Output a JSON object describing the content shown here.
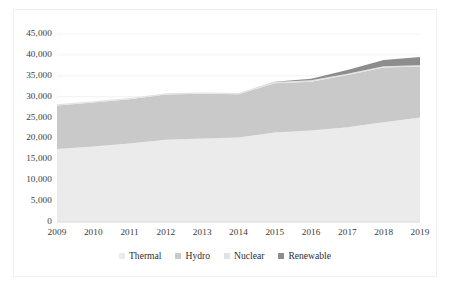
{
  "chart_data": {
    "type": "area",
    "stacked": true,
    "title": "",
    "xlabel": "",
    "ylabel": "",
    "x": [
      2009,
      2010,
      2011,
      2012,
      2013,
      2014,
      2015,
      2016,
      2017,
      2018,
      2019
    ],
    "categories": [
      "2009",
      "2010",
      "2011",
      "2012",
      "2013",
      "2014",
      "2015",
      "2016",
      "2017",
      "2018",
      "2019"
    ],
    "series": [
      {
        "name": "Thermal",
        "color": "#ebebeb",
        "values": [
          17500,
          18100,
          18800,
          19700,
          20000,
          20200,
          21400,
          21900,
          22700,
          23900,
          25000
        ]
      },
      {
        "name": "Hydro",
        "color": "#c9c9c9",
        "values": [
          10400,
          10500,
          10600,
          10800,
          10700,
          10400,
          11800,
          11700,
          12500,
          13100,
          12200
        ]
      },
      {
        "name": "Nuclear",
        "color": "#e3e3e3",
        "values": [
          300,
          300,
          300,
          300,
          300,
          300,
          300,
          300,
          300,
          300,
          300
        ]
      },
      {
        "name": "Renewable",
        "color": "#8d8d8d",
        "values": [
          0,
          0,
          0,
          0,
          0,
          0,
          100,
          400,
          900,
          1500,
          2000
        ]
      }
    ],
    "totals": [
      28200,
      28900,
      29700,
      30800,
      31000,
      30900,
      33600,
      34300,
      36400,
      38800,
      39500
    ],
    "ylim": [
      0,
      45000
    ],
    "yticks": [
      0,
      5000,
      10000,
      15000,
      20000,
      25000,
      30000,
      35000,
      40000,
      45000
    ],
    "ytick_labels": [
      "0",
      "5,000",
      "10,000",
      "15,000",
      "20,000",
      "25,000",
      "30,000",
      "35,000",
      "40,000",
      "45,000"
    ],
    "grid": true,
    "legend_position": "bottom",
    "legend": [
      "Thermal",
      "Hydro",
      "Nuclear",
      "Renewable"
    ]
  },
  "legend": {
    "items": [
      {
        "label": "Thermal",
        "color": "#ebebeb"
      },
      {
        "label": "Hydro",
        "color": "#c9c9c9"
      },
      {
        "label": "Nuclear",
        "color": "#e3e3e3"
      },
      {
        "label": "Renewable",
        "color": "#8d8d8d"
      }
    ]
  },
  "axis": {
    "y_labels": [
      "45,000",
      "40,000",
      "35,000",
      "30,000",
      "25,000",
      "20,000",
      "15,000",
      "10,000",
      "5,000",
      "0"
    ],
    "x_labels": [
      "2009",
      "2010",
      "2011",
      "2012",
      "2013",
      "2014",
      "2015",
      "2016",
      "2017",
      "2018",
      "2019"
    ]
  },
  "colors": {
    "grid": "#f2f2f2",
    "axis_text": "#3a3a3a",
    "frame": "#f0f0f0",
    "background": "#ffffff"
  }
}
